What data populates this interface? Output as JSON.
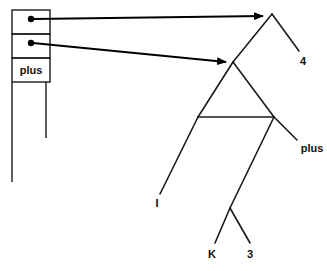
{
  "figure": {
    "background_color": "#ffffff",
    "line_color": "#1a1a1a",
    "width": 327,
    "height": 271
  },
  "cell_box": {
    "x": 12,
    "y": 10,
    "width": 38,
    "height": 72,
    "cells": [
      {
        "index": 0,
        "label": "",
        "has_pointer_dot": true,
        "dot_x": 31,
        "dot_y": 19,
        "row_y": 10,
        "row_height": 24
      },
      {
        "index": 1,
        "label": "",
        "has_pointer_dot": true,
        "dot_x": 31,
        "dot_y": 43,
        "row_y": 34,
        "row_height": 24
      },
      {
        "index": 2,
        "label": "plus",
        "has_pointer_dot": false,
        "row_y": 58,
        "row_height": 24
      }
    ],
    "stems": [
      {
        "name": "outer-left-stem",
        "x": 12,
        "y1": 82,
        "y2": 182
      },
      {
        "name": "inner-right-stem",
        "x": 46,
        "y1": 82,
        "y2": 138
      }
    ]
  },
  "pointers": [
    {
      "name": "pointer-to-upper-tree",
      "from_x": 31,
      "from_y": 19,
      "to_x": 265,
      "to_y": 16,
      "target": "upper-tree-root"
    },
    {
      "name": "pointer-to-lower-tree",
      "from_x": 31,
      "from_y": 43,
      "to_x": 228,
      "to_y": 62,
      "target": "lower-tree-root"
    }
  ],
  "trees": [
    {
      "name": "upper-tree",
      "root": {
        "x": 272,
        "y": 14
      },
      "edges": [
        {
          "name": "upper-left-edge",
          "x1": 272,
          "y1": 14,
          "x2": 233,
          "y2": 62
        },
        {
          "name": "upper-right-edge",
          "x1": 272,
          "y1": 14,
          "x2": 299,
          "y2": 51
        }
      ],
      "leaves": [
        {
          "label": "4",
          "x": 303,
          "y": 62
        }
      ]
    },
    {
      "name": "lower-tree",
      "root": {
        "x": 233,
        "y": 62
      },
      "edges": [
        {
          "name": "lower-left-edge",
          "x1": 233,
          "y1": 62,
          "x2": 198,
          "y2": 117
        },
        {
          "name": "lower-right-edge",
          "x1": 233,
          "y1": 62,
          "x2": 274,
          "y2": 117
        },
        {
          "name": "crossbar-edge",
          "x1": 198,
          "y1": 117,
          "x2": 274,
          "y2": 117
        },
        {
          "name": "leaf-i-edge",
          "x1": 198,
          "y1": 117,
          "x2": 160,
          "y2": 194
        },
        {
          "name": "plus-edge",
          "x1": 274,
          "y1": 117,
          "x2": 297,
          "y2": 140
        },
        {
          "name": "diagonal-to-k3-edge",
          "x1": 274,
          "y1": 117,
          "x2": 230,
          "y2": 208
        },
        {
          "name": "k-edge",
          "x1": 230,
          "y1": 208,
          "x2": 215,
          "y2": 243
        },
        {
          "name": "three-edge",
          "x1": 230,
          "y1": 208,
          "x2": 250,
          "y2": 243
        }
      ],
      "leaves": [
        {
          "label": "I",
          "x": 157,
          "y": 204
        },
        {
          "label": "plus",
          "x": 312,
          "y": 149
        },
        {
          "label": "K",
          "x": 212,
          "y": 255
        },
        {
          "label": "3",
          "x": 250,
          "y": 255
        }
      ]
    }
  ],
  "labels": {
    "cell_plus": "plus",
    "leaf_4": "4",
    "leaf_plus": "plus",
    "leaf_i": "I",
    "leaf_k": "K",
    "leaf_3": "3"
  }
}
